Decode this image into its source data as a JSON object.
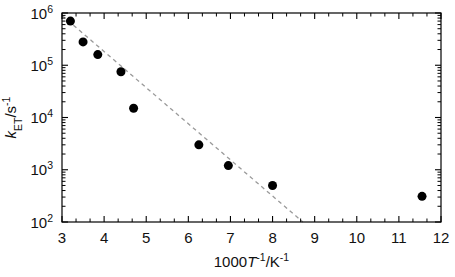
{
  "chart_data": {
    "type": "scatter",
    "title": "",
    "subtitle": "",
    "xlabel": "1000 T⁻¹/K⁻¹",
    "xlabel_parts": {
      "prefix": "1000",
      "italic_symbol": "T",
      "exp1": "-1",
      "separator": "/K",
      "exp2": "-1"
    },
    "ylabel": "k_ET/s⁻¹",
    "ylabel_parts": {
      "italic_symbol": "k",
      "subscript": "ET",
      "separator": "/s",
      "exp": "-1"
    },
    "x_scale": "linear",
    "y_scale": "log",
    "xlim": [
      3,
      12
    ],
    "ylim": [
      100,
      1000000
    ],
    "x_ticks": [
      3,
      4,
      5,
      6,
      7,
      8,
      9,
      10,
      11,
      12
    ],
    "x_tick_labels": [
      "3",
      "4",
      "5",
      "6",
      "7",
      "8",
      "9",
      "10",
      "11",
      "12"
    ],
    "x_minor_ticks_per_interval": 2,
    "y_ticks": [
      100,
      1000,
      10000,
      100000,
      1000000
    ],
    "y_tick_labels": [
      "10",
      "10",
      "10",
      "10",
      "10"
    ],
    "y_tick_exponents": [
      "2",
      "3",
      "4",
      "5",
      "6"
    ],
    "y_minor_ticks": "log-decade",
    "grid": false,
    "legend": null,
    "frame": "box",
    "tick_direction": "in",
    "marker": {
      "shape": "circle",
      "color": "#000000",
      "size_px": 9
    },
    "x": [
      3.2,
      3.5,
      3.85,
      4.4,
      4.7,
      6.25,
      6.95,
      8.0,
      11.55
    ],
    "y": [
      700000,
      280000,
      160000,
      75000,
      15000,
      3000,
      1200,
      500,
      310
    ],
    "points": [
      {
        "x": 3.2,
        "y": 700000
      },
      {
        "x": 3.5,
        "y": 280000
      },
      {
        "x": 3.85,
        "y": 160000
      },
      {
        "x": 4.4,
        "y": 75000
      },
      {
        "x": 4.7,
        "y": 15000
      },
      {
        "x": 6.25,
        "y": 3000
      },
      {
        "x": 6.95,
        "y": 1200
      },
      {
        "x": 8.0,
        "y": 500
      },
      {
        "x": 11.55,
        "y": 310
      }
    ],
    "fit_line": {
      "style": "dashed",
      "color": "#9a9a9a",
      "x_start": 3.0,
      "y_start": 900000,
      "x_end": 8.72,
      "y_end": 100
    },
    "colors": {
      "axis": "#000000",
      "marker": "#000000",
      "fit": "#9a9a9a",
      "background": "#ffffff"
    }
  }
}
